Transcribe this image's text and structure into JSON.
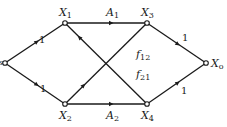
{
  "diagram": {
    "type": "signal-flow-graph",
    "nodes": [
      {
        "id": "Xs",
        "label": "X",
        "sub": "s",
        "x": 5,
        "y": 63
      },
      {
        "id": "X1",
        "label": "X",
        "sub": "1",
        "x": 65,
        "y": 23
      },
      {
        "id": "X2",
        "label": "X",
        "sub": "2",
        "x": 65,
        "y": 104
      },
      {
        "id": "X3",
        "label": "X",
        "sub": "3",
        "x": 147,
        "y": 23
      },
      {
        "id": "X4",
        "label": "X",
        "sub": "4",
        "x": 147,
        "y": 104
      },
      {
        "id": "Xo",
        "label": "X",
        "sub": "o",
        "x": 206,
        "y": 63
      }
    ],
    "edges": [
      {
        "from": "Xs",
        "to": "X1",
        "gain": "1"
      },
      {
        "from": "Xs",
        "to": "X2",
        "gain": "1"
      },
      {
        "from": "X1",
        "to": "X3",
        "gain": "A",
        "gain_sub": "1"
      },
      {
        "from": "X2",
        "to": "X4",
        "gain": "A",
        "gain_sub": "2"
      },
      {
        "from": "X3",
        "to": "Xo",
        "gain": "1"
      },
      {
        "from": "X4",
        "to": "Xo",
        "gain": "1"
      },
      {
        "from": "X2",
        "to": "X3",
        "gain": "f",
        "gain_sub": "12"
      },
      {
        "from": "X4",
        "to": "X1",
        "gain": "f",
        "gain_sub": "21"
      }
    ]
  },
  "labels": {
    "xs": {
      "main": "X",
      "sub": "s"
    },
    "x1": {
      "main": "X",
      "sub": "1"
    },
    "x2": {
      "main": "X",
      "sub": "2"
    },
    "x3": {
      "main": "X",
      "sub": "3"
    },
    "x4": {
      "main": "X",
      "sub": "4"
    },
    "xo": {
      "main": "X",
      "sub": "o"
    },
    "a1": {
      "main": "A",
      "sub": "1"
    },
    "a2": {
      "main": "A",
      "sub": "2"
    },
    "f12": {
      "main": "f",
      "sub": "12"
    },
    "f21": {
      "main": "f",
      "sub": "21"
    },
    "g_s1": "1",
    "g_s2": "1",
    "g_3o": "1",
    "g_4o": "1"
  },
  "colors": {
    "line": "#1a1a1a",
    "background": "#ffffff"
  }
}
